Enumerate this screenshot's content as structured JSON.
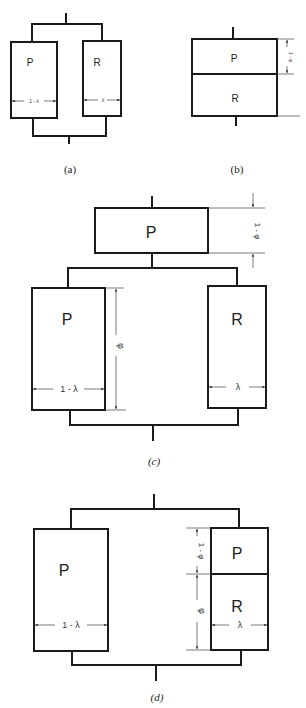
{
  "diagrams": {
    "a": {
      "caption": "(a)",
      "left_box": {
        "label": "P",
        "width_label": "1 - λ"
      },
      "right_box": {
        "label": "R",
        "width_label": "λ"
      }
    },
    "b": {
      "caption": "(b)",
      "top_box": {
        "label": "P"
      },
      "bottom_box": {
        "label": "R"
      },
      "height_label": "1 - φ"
    },
    "c": {
      "caption": "(c)",
      "top_box": {
        "label": "P",
        "height_label": "1 - φ"
      },
      "left_box": {
        "label": "P",
        "width_label": "1 - λ",
        "height_label": "φ"
      },
      "right_box": {
        "label": "R",
        "width_label": "λ"
      }
    },
    "d": {
      "caption": "(d)",
      "left_box": {
        "label": "P",
        "width_label": "1 - λ"
      },
      "right_top_box": {
        "label": "P",
        "height_label": "1 - φ"
      },
      "right_bottom_box": {
        "label": "R",
        "width_label": "λ",
        "height_label": "φ"
      }
    }
  },
  "colors": {
    "line": "#1a1a1a",
    "background": "#ffffff"
  }
}
